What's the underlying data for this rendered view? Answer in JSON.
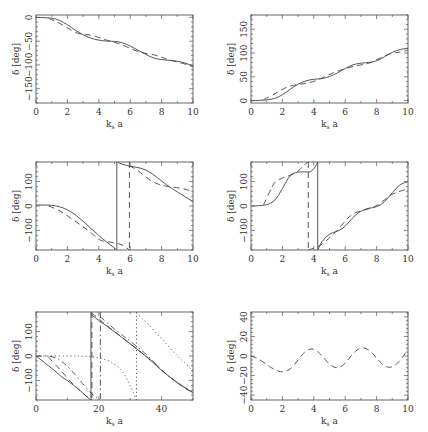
{
  "figure": {
    "xlabel": "k_s a",
    "ylabel": "δ [deg]"
  },
  "chart_data": [
    {
      "panel": "top-left",
      "type": "line",
      "xlabel": "k_s a",
      "ylabel": "δ [deg]",
      "xlim": [
        0,
        10
      ],
      "ylim": [
        -180,
        5
      ],
      "xticks": [
        0,
        2,
        4,
        6,
        8,
        10
      ],
      "yticks": [
        0,
        -50,
        -100,
        -150
      ],
      "ytick_labels": [
        "0",
        "−50",
        "−100",
        "−150"
      ],
      "grid": false,
      "series": [
        {
          "name": "solid",
          "style": "solid",
          "x": [
            0,
            1,
            1.5,
            2,
            2.5,
            3,
            3.5,
            4,
            4.5,
            5,
            5.5,
            6,
            6.5,
            7,
            7.5,
            8,
            8.5,
            9,
            9.5,
            10
          ],
          "y": [
            0,
            -1,
            -6,
            -15,
            -27,
            -37,
            -44,
            -48,
            -50,
            -50,
            -53,
            -60,
            -69,
            -78,
            -86,
            -89,
            -90,
            -92,
            -96,
            -102
          ]
        },
        {
          "name": "dashed",
          "style": "dashed",
          "x": [
            0.8,
            1.5,
            2,
            2.5,
            3,
            3.5,
            4,
            4.5,
            5,
            5.5,
            6,
            6.5,
            7,
            7.5,
            8,
            8.5,
            9,
            9.5,
            10
          ],
          "y": [
            -2,
            -12,
            -22,
            -32,
            -36,
            -37,
            -42,
            -48,
            -52,
            -58,
            -65,
            -72,
            -76,
            -78,
            -84,
            -90,
            -94,
            -98,
            -104
          ]
        }
      ]
    },
    {
      "panel": "top-right",
      "type": "line",
      "xlabel": "k_s a",
      "ylabel": "δ [deg]",
      "xlim": [
        0,
        10
      ],
      "ylim": [
        -5,
        180
      ],
      "xticks": [
        0,
        2,
        4,
        6,
        8,
        10
      ],
      "yticks": [
        0,
        50,
        100,
        150
      ],
      "grid": false,
      "series": [
        {
          "name": "solid",
          "style": "solid",
          "x": [
            0,
            1,
            1.5,
            2,
            2.5,
            3,
            3.5,
            4,
            4.5,
            5,
            5.5,
            6,
            6.5,
            7,
            7.5,
            8,
            8.5,
            9,
            9.5,
            10
          ],
          "y": [
            0,
            1,
            4,
            12,
            24,
            35,
            42,
            45,
            46,
            50,
            58,
            68,
            76,
            79,
            80,
            83,
            92,
            102,
            108,
            110
          ]
        },
        {
          "name": "dashed",
          "style": "dashed",
          "x": [
            0.8,
            1.5,
            2,
            2.5,
            3,
            3.5,
            4,
            4.5,
            5,
            5.5,
            6,
            6.5,
            7,
            7.5,
            8,
            8.5,
            9,
            9.5,
            10
          ],
          "y": [
            2,
            14,
            24,
            31,
            34,
            36,
            40,
            47,
            55,
            62,
            67,
            72,
            75,
            78,
            86,
            94,
            100,
            102,
            106
          ]
        }
      ]
    },
    {
      "panel": "middle-left",
      "type": "line",
      "xlabel": "k_s a",
      "ylabel": "δ [deg]",
      "xlim": [
        0,
        10
      ],
      "ylim": [
        -180,
        180
      ],
      "xticks": [
        0,
        2,
        4,
        6,
        8,
        10
      ],
      "yticks": [
        100,
        0,
        -100
      ],
      "ytick_labels": [
        "100",
        "0",
        "−100"
      ],
      "grid": false,
      "series": [
        {
          "name": "solid",
          "style": "solid",
          "wraps_at_x": 5.15,
          "x": [
            0,
            0.5,
            1,
            1.5,
            2,
            2.5,
            3,
            3.5,
            4,
            4.5,
            5,
            5.15,
            5.15,
            5.5,
            6,
            6.5,
            7,
            7.5,
            8,
            8.5,
            9,
            9.5,
            10
          ],
          "y": [
            4,
            4,
            3,
            -2,
            -15,
            -35,
            -62,
            -92,
            -120,
            -148,
            -172,
            -180,
            180,
            170,
            162,
            158,
            148,
            128,
            102,
            78,
            58,
            38,
            18
          ]
        },
        {
          "name": "dashed",
          "style": "dashed",
          "wraps_at_x": 5.95,
          "x": [
            0.8,
            1.5,
            2,
            2.5,
            3,
            3.5,
            4,
            4.5,
            5,
            5.5,
            5.95,
            5.95,
            6.5,
            7,
            7.5,
            8,
            8.5,
            9,
            9.5,
            10
          ],
          "y": [
            0,
            -18,
            -40,
            -62,
            -85,
            -108,
            -140,
            -146,
            -150,
            -158,
            -180,
            165,
            145,
            118,
            96,
            85,
            78,
            75,
            70,
            58
          ]
        }
      ]
    },
    {
      "panel": "middle-right",
      "type": "line",
      "xlabel": "k_s a",
      "ylabel": "δ [deg]",
      "xlim": [
        0,
        10
      ],
      "ylim": [
        -180,
        180
      ],
      "xticks": [
        0,
        2,
        4,
        6,
        8,
        10
      ],
      "yticks": [
        100,
        0,
        -100
      ],
      "ytick_labels": [
        "100",
        "0",
        "−100"
      ],
      "grid": false,
      "series": [
        {
          "name": "solid",
          "style": "solid",
          "wraps_at_x": 4.25,
          "x": [
            0,
            0.5,
            1,
            1.5,
            2,
            2.5,
            3,
            3.5,
            3.8,
            4.1,
            4.25,
            4.25,
            4.5,
            5,
            5.5,
            6,
            6.5,
            7,
            7.5,
            8,
            8.5,
            9,
            9.5,
            10
          ],
          "y": [
            0,
            1,
            4,
            18,
            70,
            130,
            140,
            140,
            138,
            160,
            180,
            -180,
            -145,
            -112,
            -105,
            -85,
            -45,
            -20,
            -8,
            -5,
            15,
            55,
            90,
            100
          ]
        },
        {
          "name": "dashed",
          "style": "dashed",
          "wraps_at_x": 3.65,
          "x": [
            0.8,
            1.2,
            1.5,
            2,
            2.5,
            3,
            3.3,
            3.65,
            3.65,
            3.9,
            4.5,
            5,
            5.5,
            6,
            6.5,
            7,
            7.5,
            8,
            8.5,
            9,
            9.5,
            10
          ],
          "y": [
            5,
            60,
            100,
            115,
            125,
            140,
            165,
            180,
            -180,
            -175,
            -160,
            -130,
            -100,
            -60,
            -30,
            -20,
            -12,
            0,
            25,
            50,
            60,
            72
          ]
        }
      ]
    },
    {
      "panel": "bottom-left",
      "type": "line",
      "xlabel": "k_s a",
      "ylabel": "δ [deg]",
      "xlim": [
        0,
        50
      ],
      "ylim": [
        -180,
        180
      ],
      "xticks": [
        0,
        20,
        40
      ],
      "yticks": [
        100,
        0,
        -100
      ],
      "ytick_labels": [
        "100",
        "0",
        "−100"
      ],
      "grid": false,
      "series": [
        {
          "name": "solid",
          "style": "solid",
          "wraps_at_x": 17.5,
          "x": [
            0,
            2,
            4,
            6,
            8,
            10,
            12,
            14,
            16,
            17.5,
            17.5,
            20,
            25,
            30,
            35,
            40,
            45,
            50
          ],
          "y": [
            0,
            -20,
            -40,
            -60,
            -85,
            -100,
            -120,
            -140,
            -165,
            -180,
            170,
            145,
            100,
            50,
            0,
            -60,
            -110,
            -150
          ]
        },
        {
          "name": "long-dash",
          "style": "dashed",
          "wraps_at_x": 17.8,
          "x": [
            4,
            8,
            12,
            16,
            17.8,
            17.8,
            22,
            27,
            32,
            37,
            42,
            47,
            50
          ],
          "y": [
            -5,
            -60,
            -120,
            -165,
            -180,
            175,
            130,
            80,
            30,
            -20,
            -80,
            -130,
            -150
          ]
        },
        {
          "name": "dash-dot",
          "style": "dashdot",
          "wraps_at_x": 20.5,
          "x": [
            0,
            6,
            10,
            14,
            18,
            20.5,
            20.5,
            25,
            30,
            35,
            40,
            45,
            50
          ],
          "y": [
            0,
            0,
            -40,
            -100,
            -160,
            -180,
            160,
            110,
            60,
            10,
            -60,
            -110,
            -150
          ]
        },
        {
          "name": "dotted",
          "style": "dotted",
          "wraps_at_x": 32,
          "x": [
            0,
            15,
            20,
            25,
            28,
            30,
            32,
            32,
            35,
            40,
            45,
            50
          ],
          "y": [
            0,
            0,
            -5,
            -30,
            -70,
            -120,
            -180,
            175,
            140,
            70,
            0,
            -60
          ]
        }
      ]
    },
    {
      "panel": "bottom-right",
      "type": "line",
      "xlabel": "k_s a",
      "ylabel": "δ [deg]",
      "xlim": [
        0,
        10
      ],
      "ylim": [
        -45,
        45
      ],
      "xticks": [
        0,
        2,
        4,
        6,
        8,
        10
      ],
      "yticks": [
        40,
        20,
        0,
        -20,
        -40
      ],
      "ytick_labels": [
        "40",
        "20",
        "0",
        "−20",
        "−40"
      ],
      "grid": false,
      "series": [
        {
          "name": "dashed",
          "style": "dashed",
          "x": [
            0,
            0.5,
            1,
            1.5,
            2,
            2.5,
            3,
            3.5,
            4,
            4.5,
            5,
            5.5,
            6,
            6.5,
            7,
            7.5,
            8,
            8.5,
            9,
            9.5,
            10
          ],
          "y": [
            0,
            -3,
            -9,
            -14,
            -17,
            -14,
            -4,
            6,
            8,
            1,
            -9,
            -13,
            -8,
            3,
            9,
            7,
            -2,
            -11,
            -12,
            -5,
            7
          ]
        }
      ]
    }
  ],
  "panels_layout": [
    {
      "left": 36,
      "top": 15,
      "width": 157,
      "height": 88
    },
    {
      "left": 251,
      "top": 15,
      "width": 157,
      "height": 88
    },
    {
      "left": 36,
      "top": 162,
      "width": 157,
      "height": 88
    },
    {
      "left": 251,
      "top": 162,
      "width": 157,
      "height": 88
    },
    {
      "left": 36,
      "top": 312,
      "width": 157,
      "height": 88
    },
    {
      "left": 251,
      "top": 312,
      "width": 157,
      "height": 88
    }
  ]
}
